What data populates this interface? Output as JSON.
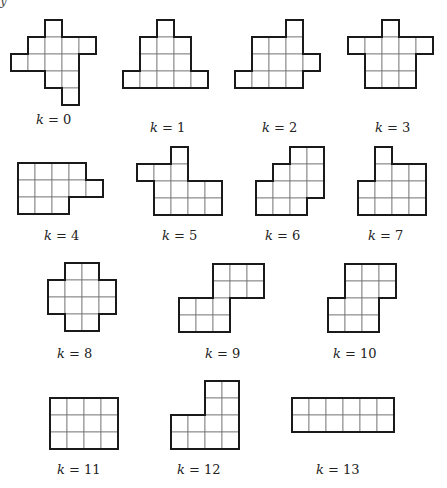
{
  "cell_size": 17,
  "colors": {
    "outline": "#1a1a1a",
    "grid": "#777777",
    "background": "#ffffff"
  },
  "top_fragment": "y",
  "shapes": [
    {
      "k": 0,
      "label": "k = 0",
      "origin": [
        11,
        20
      ],
      "label_pos": [
        36,
        112
      ],
      "cells": [
        [
          2,
          0
        ],
        [
          1,
          1
        ],
        [
          2,
          1
        ],
        [
          3,
          1
        ],
        [
          4,
          1
        ],
        [
          0,
          2
        ],
        [
          1,
          2
        ],
        [
          2,
          2
        ],
        [
          3,
          2
        ],
        [
          2,
          3
        ],
        [
          3,
          3
        ],
        [
          3,
          4
        ]
      ]
    },
    {
      "k": 1,
      "label": "k = 1",
      "origin": [
        123,
        20
      ],
      "label_pos": [
        150,
        120
      ],
      "cells": [
        [
          2,
          0
        ],
        [
          1,
          1
        ],
        [
          2,
          1
        ],
        [
          3,
          1
        ],
        [
          1,
          2
        ],
        [
          2,
          2
        ],
        [
          3,
          2
        ],
        [
          0,
          3
        ],
        [
          1,
          3
        ],
        [
          2,
          3
        ],
        [
          3,
          3
        ],
        [
          4,
          3
        ]
      ]
    },
    {
      "k": 2,
      "label": "k = 2",
      "origin": [
        235,
        20
      ],
      "label_pos": [
        262,
        120
      ],
      "cells": [
        [
          3,
          0
        ],
        [
          1,
          1
        ],
        [
          2,
          1
        ],
        [
          3,
          1
        ],
        [
          1,
          2
        ],
        [
          2,
          2
        ],
        [
          3,
          2
        ],
        [
          4,
          2
        ],
        [
          0,
          3
        ],
        [
          1,
          3
        ],
        [
          2,
          3
        ],
        [
          3,
          3
        ]
      ]
    },
    {
      "k": 3,
      "label": "k = 3",
      "origin": [
        348,
        20
      ],
      "label_pos": [
        375,
        120
      ],
      "cells": [
        [
          2,
          0
        ],
        [
          0,
          1
        ],
        [
          1,
          1
        ],
        [
          2,
          1
        ],
        [
          3,
          1
        ],
        [
          4,
          1
        ],
        [
          1,
          2
        ],
        [
          2,
          2
        ],
        [
          3,
          2
        ],
        [
          1,
          3
        ],
        [
          2,
          3
        ],
        [
          3,
          3
        ]
      ]
    },
    {
      "k": 4,
      "label": "k = 4",
      "origin": [
        18,
        163
      ],
      "label_pos": [
        44,
        228
      ],
      "cells": [
        [
          0,
          0
        ],
        [
          1,
          0
        ],
        [
          2,
          0
        ],
        [
          3,
          0
        ],
        [
          0,
          1
        ],
        [
          1,
          1
        ],
        [
          2,
          1
        ],
        [
          3,
          1
        ],
        [
          4,
          1
        ],
        [
          0,
          2
        ],
        [
          1,
          2
        ],
        [
          2,
          2
        ]
      ]
    },
    {
      "k": 5,
      "label": "k = 5",
      "origin": [
        137,
        147
      ],
      "label_pos": [
        162,
        228
      ],
      "cells": [
        [
          2,
          0
        ],
        [
          0,
          1
        ],
        [
          1,
          1
        ],
        [
          2,
          1
        ],
        [
          1,
          2
        ],
        [
          2,
          2
        ],
        [
          3,
          2
        ],
        [
          4,
          2
        ],
        [
          1,
          3
        ],
        [
          2,
          3
        ],
        [
          3,
          3
        ],
        [
          4,
          3
        ]
      ]
    },
    {
      "k": 6,
      "label": "k = 6",
      "origin": [
        256,
        147
      ],
      "label_pos": [
        265,
        228
      ],
      "cells": [
        [
          2,
          0
        ],
        [
          3,
          0
        ],
        [
          1,
          1
        ],
        [
          2,
          1
        ],
        [
          3,
          1
        ],
        [
          0,
          2
        ],
        [
          1,
          2
        ],
        [
          2,
          2
        ],
        [
          3,
          2
        ],
        [
          0,
          3
        ],
        [
          1,
          3
        ],
        [
          2,
          3
        ]
      ]
    },
    {
      "k": 7,
      "label": "k = 7",
      "origin": [
        358,
        147
      ],
      "label_pos": [
        368,
        228
      ],
      "cells": [
        [
          1,
          0
        ],
        [
          1,
          1
        ],
        [
          2,
          1
        ],
        [
          3,
          1
        ],
        [
          0,
          2
        ],
        [
          1,
          2
        ],
        [
          2,
          2
        ],
        [
          3,
          2
        ],
        [
          0,
          3
        ],
        [
          1,
          3
        ],
        [
          2,
          3
        ],
        [
          3,
          3
        ]
      ]
    },
    {
      "k": 8,
      "label": "k = 8",
      "origin": [
        48,
        263
      ],
      "label_pos": [
        57,
        346
      ],
      "cells": [
        [
          1,
          0
        ],
        [
          2,
          0
        ],
        [
          0,
          1
        ],
        [
          1,
          1
        ],
        [
          2,
          1
        ],
        [
          3,
          1
        ],
        [
          0,
          2
        ],
        [
          1,
          2
        ],
        [
          2,
          2
        ],
        [
          3,
          2
        ],
        [
          1,
          3
        ],
        [
          2,
          3
        ]
      ]
    },
    {
      "k": 9,
      "label": "k = 9",
      "origin": [
        179,
        264
      ],
      "label_pos": [
        205,
        346
      ],
      "cells": [
        [
          2,
          0
        ],
        [
          3,
          0
        ],
        [
          4,
          0
        ],
        [
          2,
          1
        ],
        [
          3,
          1
        ],
        [
          4,
          1
        ],
        [
          0,
          2
        ],
        [
          1,
          2
        ],
        [
          2,
          2
        ],
        [
          0,
          3
        ],
        [
          1,
          3
        ],
        [
          2,
          3
        ]
      ]
    },
    {
      "k": 10,
      "label": "k = 10",
      "origin": [
        328,
        264
      ],
      "label_pos": [
        333,
        346
      ],
      "cells": [
        [
          1,
          0
        ],
        [
          2,
          0
        ],
        [
          3,
          0
        ],
        [
          1,
          1
        ],
        [
          2,
          1
        ],
        [
          3,
          1
        ],
        [
          0,
          2
        ],
        [
          1,
          2
        ],
        [
          2,
          2
        ],
        [
          0,
          3
        ],
        [
          1,
          3
        ],
        [
          2,
          3
        ]
      ]
    },
    {
      "k": 11,
      "label": "k = 11",
      "origin": [
        50,
        398
      ],
      "label_pos": [
        57,
        462
      ],
      "cells": [
        [
          0,
          0
        ],
        [
          1,
          0
        ],
        [
          2,
          0
        ],
        [
          3,
          0
        ],
        [
          0,
          1
        ],
        [
          1,
          1
        ],
        [
          2,
          1
        ],
        [
          3,
          1
        ],
        [
          0,
          2
        ],
        [
          1,
          2
        ],
        [
          2,
          2
        ],
        [
          3,
          2
        ]
      ]
    },
    {
      "k": 12,
      "label": "k = 12",
      "origin": [
        171,
        381
      ],
      "label_pos": [
        177,
        462
      ],
      "cells": [
        [
          2,
          0
        ],
        [
          3,
          0
        ],
        [
          2,
          1
        ],
        [
          3,
          1
        ],
        [
          0,
          2
        ],
        [
          1,
          2
        ],
        [
          2,
          2
        ],
        [
          3,
          2
        ],
        [
          0,
          3
        ],
        [
          1,
          3
        ],
        [
          2,
          3
        ],
        [
          3,
          3
        ]
      ]
    },
    {
      "k": 13,
      "label": "k = 13",
      "origin": [
        292,
        398
      ],
      "label_pos": [
        316,
        462
      ],
      "cells": [
        [
          0,
          0
        ],
        [
          1,
          0
        ],
        [
          2,
          0
        ],
        [
          3,
          0
        ],
        [
          4,
          0
        ],
        [
          5,
          0
        ],
        [
          0,
          1
        ],
        [
          1,
          1
        ],
        [
          2,
          1
        ],
        [
          3,
          1
        ],
        [
          4,
          1
        ],
        [
          5,
          1
        ]
      ]
    }
  ]
}
